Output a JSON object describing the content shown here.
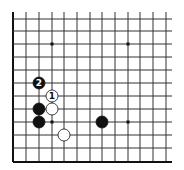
{
  "diagram": {
    "type": "go-board-fragment",
    "grid": {
      "x_lines": [
        13,
        26,
        39,
        52,
        64,
        77,
        90,
        102,
        115,
        128,
        140,
        153,
        166
      ],
      "y_lines": [
        19,
        31,
        44,
        57,
        70,
        83,
        96,
        109,
        122,
        135,
        148,
        162
      ],
      "x_extent": [
        13,
        172
      ],
      "y_extent": [
        12,
        162
      ],
      "edge_left": true,
      "edge_bottom": true,
      "edge_top": false,
      "edge_right": false,
      "line_color": "#333333",
      "edge_color": "#111111"
    },
    "star_points": [
      {
        "x": 52,
        "y": 44
      },
      {
        "x": 128,
        "y": 44
      },
      {
        "x": 52,
        "y": 122
      },
      {
        "x": 128,
        "y": 122
      }
    ],
    "stones": [
      {
        "color": "black",
        "x": 39,
        "y": 83,
        "label": "2"
      },
      {
        "color": "white",
        "x": 52,
        "y": 96,
        "label": "1"
      },
      {
        "color": "black",
        "x": 39,
        "y": 109,
        "label": ""
      },
      {
        "color": "white",
        "x": 52,
        "y": 109,
        "label": ""
      },
      {
        "color": "black",
        "x": 39,
        "y": 122,
        "label": ""
      },
      {
        "color": "black",
        "x": 102,
        "y": 122,
        "label": ""
      },
      {
        "color": "white",
        "x": 64,
        "y": 135,
        "label": ""
      }
    ],
    "stone_radius": 6
  }
}
